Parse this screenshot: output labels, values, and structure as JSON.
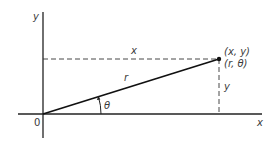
{
  "diagram": {
    "type": "polar-cartesian-coordinates",
    "colors": {
      "line": "#222222",
      "text": "#3a3a3a",
      "background": "#ffffff"
    },
    "axes": {
      "x_label": "x",
      "y_label": "y",
      "origin_label": "0"
    },
    "point": {
      "cartesian_label": "(x, y)",
      "polar_label": "(r, θ)"
    },
    "segments": {
      "horizontal_dashed_label": "x",
      "vertical_dashed_label": "y",
      "radius_label": "r",
      "angle_label": "θ"
    }
  }
}
